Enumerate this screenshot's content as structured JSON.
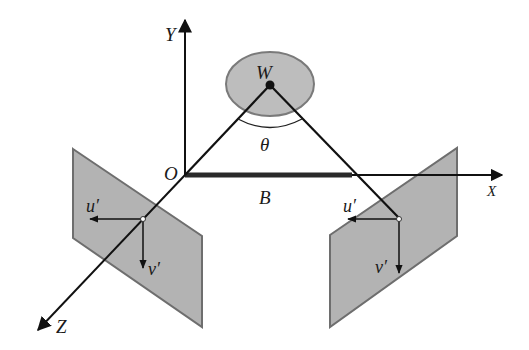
{
  "diagram": {
    "colors": {
      "line": "#111111",
      "plane_fill": "#b3b3b3",
      "plane_stroke": "#6e6e6e",
      "object_fill": "#bdbdbd",
      "object_stroke": "#7a7a7a",
      "background": "#ffffff"
    },
    "axes": {
      "x_label": "X",
      "y_label": "Y",
      "z_label": "Z",
      "origin_label": "O"
    },
    "object": {
      "point_label": "W",
      "angle_label": "θ"
    },
    "baseline_label": "B",
    "left_camera": {
      "u_label": "u′",
      "v_label": "v′"
    },
    "right_camera": {
      "u_label": "u′",
      "v_label": "v′"
    }
  }
}
